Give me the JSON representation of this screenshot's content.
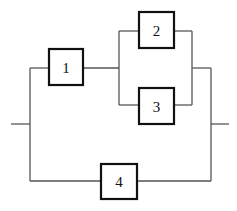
{
  "diagram": {
    "type": "reliability-block-diagram",
    "blocks": [
      {
        "id": "1",
        "label": "1"
      },
      {
        "id": "2",
        "label": "2"
      },
      {
        "id": "3",
        "label": "3"
      },
      {
        "id": "4",
        "label": "4"
      }
    ],
    "structure": "((1 series (2 parallel 3)) parallel 4)",
    "colors": {
      "wire": "#555555",
      "block_border": "#111111",
      "background": "#ffffff"
    }
  }
}
